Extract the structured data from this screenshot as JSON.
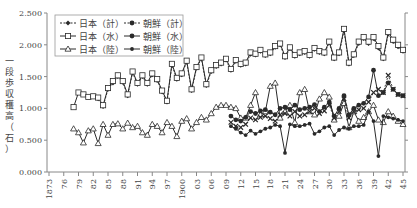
{
  "chart_data": {
    "type": "line",
    "title": "",
    "xlabel": "",
    "ylabel": "一段歩収穫高（石）",
    "ylim": [
      0,
      2.5
    ],
    "yticks": [
      "0.000",
      "0.500",
      "1.000",
      "1.500",
      "2.000",
      "2.500"
    ],
    "xticks": [
      "1873",
      "76",
      "79",
      "82",
      "85",
      "88",
      "91",
      "94",
      "97",
      "1900",
      "03",
      "06",
      "09",
      "12",
      "15",
      "18",
      "21",
      "24",
      "27",
      "30",
      "33",
      "36",
      "39",
      "42",
      "45"
    ],
    "xrange": [
      1873,
      1945
    ],
    "grid": false,
    "legend_position": "upper-left",
    "legend": [
      "日本（計）",
      "日本（水）",
      "日本（陸）",
      "朝鮮（計）",
      "朝鮮（水）",
      "朝鮮（陸）"
    ],
    "series": [
      {
        "name": "日本（水）",
        "marker": "open-square",
        "line": "solid",
        "x": [
          1878,
          1879,
          1880,
          1881,
          1882,
          1883,
          1884,
          1885,
          1886,
          1887,
          1888,
          1889,
          1890,
          1891,
          1892,
          1893,
          1894,
          1895,
          1896,
          1897,
          1898,
          1899,
          1900,
          1901,
          1902,
          1903,
          1904,
          1905,
          1906,
          1907,
          1908,
          1909,
          1910,
          1911,
          1912,
          1913,
          1914,
          1915,
          1916,
          1917,
          1918,
          1919,
          1920,
          1921,
          1922,
          1923,
          1924,
          1925,
          1926,
          1927,
          1928,
          1929,
          1930,
          1931,
          1932,
          1933,
          1934,
          1935,
          1936,
          1937,
          1938,
          1939,
          1940,
          1941,
          1942,
          1943,
          1944,
          1945
        ],
        "values": [
          1.02,
          1.25,
          1.22,
          1.18,
          1.19,
          1.17,
          1.05,
          1.32,
          1.43,
          1.52,
          1.43,
          1.22,
          1.58,
          1.4,
          1.52,
          1.4,
          1.55,
          1.46,
          1.28,
          1.12,
          1.7,
          1.48,
          1.55,
          1.75,
          1.3,
          1.65,
          1.8,
          1.38,
          1.6,
          1.68,
          1.72,
          1.78,
          1.62,
          1.76,
          1.7,
          1.72,
          1.88,
          1.86,
          1.92,
          1.85,
          1.88,
          1.98,
          2.02,
          1.82,
          1.96,
          1.84,
          1.88,
          1.9,
          1.84,
          1.95,
          1.9,
          1.88,
          2.05,
          1.8,
          1.88,
          2.25,
          1.72,
          1.85,
          2.05,
          2.12,
          2.05,
          2.12,
          1.98,
          1.8,
          2.2,
          2.08,
          2.0,
          1.92
        ]
      },
      {
        "name": "日本（計）",
        "marker": "filled-diamond",
        "line": "dashed",
        "x": [
          1883,
          1884,
          1885,
          1886,
          1887,
          1888,
          1889,
          1890,
          1891,
          1892,
          1893,
          1894,
          1895,
          1896,
          1897,
          1898,
          1899,
          1900,
          1901,
          1902,
          1903,
          1904,
          1905,
          1906,
          1907,
          1908,
          1909,
          1910,
          1911,
          1912,
          1913,
          1914,
          1915,
          1916,
          1917,
          1918,
          1919,
          1920,
          1921,
          1922,
          1923,
          1924,
          1925,
          1926,
          1927,
          1928,
          1929,
          1930,
          1931,
          1932,
          1933,
          1934,
          1935,
          1936,
          1937,
          1938,
          1939,
          1940,
          1941,
          1942,
          1943,
          1944,
          1945
        ],
        "values": [
          1.15,
          1.03,
          1.3,
          1.4,
          1.5,
          1.41,
          1.2,
          1.56,
          1.38,
          1.5,
          1.38,
          1.53,
          1.44,
          1.26,
          1.1,
          1.68,
          1.46,
          1.53,
          1.73,
          1.28,
          1.63,
          1.78,
          1.36,
          1.58,
          1.66,
          1.7,
          1.76,
          1.6,
          1.74,
          1.68,
          1.7,
          1.85,
          1.84,
          1.9,
          1.83,
          1.86,
          1.96,
          2.0,
          1.8,
          1.94,
          1.82,
          1.86,
          1.88,
          1.82,
          1.93,
          1.88,
          1.86,
          2.03,
          1.78,
          1.86,
          2.22,
          1.7,
          1.83,
          2.02,
          2.1,
          2.02,
          2.1,
          1.95,
          1.78,
          2.17,
          2.05,
          1.97,
          1.9
        ]
      },
      {
        "name": "日本（陸）",
        "marker": "open-triangle",
        "line": "solid",
        "x": [
          1878,
          1879,
          1880,
          1881,
          1882,
          1883,
          1884,
          1885,
          1886,
          1887,
          1888,
          1889,
          1890,
          1891,
          1892,
          1893,
          1894,
          1895,
          1896,
          1897,
          1898,
          1899,
          1900,
          1901,
          1902,
          1903,
          1904,
          1905,
          1906,
          1907,
          1908,
          1909,
          1910,
          1911,
          1912,
          1913,
          1914,
          1915,
          1916,
          1917,
          1918,
          1919,
          1920,
          1921,
          1922,
          1923,
          1924,
          1925,
          1926,
          1927,
          1928,
          1929,
          1930,
          1931,
          1932,
          1933,
          1934,
          1935,
          1936,
          1937,
          1938,
          1939,
          1940,
          1941,
          1942,
          1943,
          1944,
          1945
        ],
        "values": [
          0.68,
          0.62,
          0.46,
          0.65,
          0.68,
          0.45,
          0.75,
          0.58,
          0.75,
          0.76,
          0.68,
          0.77,
          0.7,
          0.72,
          0.62,
          0.58,
          0.75,
          0.72,
          0.62,
          0.78,
          0.72,
          0.56,
          0.8,
          0.84,
          0.68,
          0.78,
          0.86,
          0.82,
          0.92,
          1.02,
          1.05,
          1.05,
          1.02,
          1.0,
          0.85,
          0.85,
          1.05,
          1.25,
          0.9,
          0.95,
          1.35,
          1.4,
          0.85,
          0.95,
          1.05,
          0.78,
          1.25,
          1.3,
          0.95,
          0.9,
          1.15,
          1.25,
          1.18,
          0.82,
          0.88,
          1.08,
          0.7,
          0.95,
          0.8,
          0.86,
          0.95,
          1.05,
          0.82,
          0.78,
          0.95,
          0.88,
          0.8,
          0.75
        ]
      },
      {
        "name": "朝鮮（計）",
        "marker": "x-cross",
        "line": "dashed",
        "x": [
          1910,
          1911,
          1912,
          1913,
          1914,
          1915,
          1916,
          1917,
          1918,
          1919,
          1920,
          1921,
          1922,
          1923,
          1924,
          1925,
          1926,
          1927,
          1928,
          1929,
          1930,
          1931,
          1932,
          1933,
          1934,
          1935,
          1936,
          1937,
          1938,
          1939,
          1940,
          1941,
          1942,
          1943,
          1944,
          1945
        ],
        "values": [
          0.78,
          0.72,
          0.7,
          0.75,
          0.85,
          0.82,
          0.86,
          0.88,
          0.84,
          0.8,
          0.9,
          0.92,
          0.88,
          0.95,
          0.88,
          0.9,
          0.95,
          1.0,
          0.92,
          0.96,
          1.05,
          0.85,
          0.95,
          1.15,
          0.85,
          0.95,
          0.98,
          1.0,
          1.1,
          1.25,
          1.3,
          1.25,
          1.52,
          1.3,
          1.22,
          1.2
        ]
      },
      {
        "name": "朝鮮（水）",
        "marker": "filled-circle-bold",
        "line": "solid",
        "x": [
          1910,
          1911,
          1912,
          1913,
          1914,
          1915,
          1916,
          1917,
          1918,
          1919,
          1920,
          1921,
          1922,
          1923,
          1924,
          1925,
          1926,
          1927,
          1928,
          1929,
          1930,
          1931,
          1932,
          1933,
          1934,
          1935,
          1936,
          1937,
          1938,
          1939,
          1940,
          1941,
          1942,
          1943,
          1944,
          1945
        ],
        "values": [
          0.88,
          0.82,
          0.8,
          0.86,
          0.95,
          0.92,
          0.96,
          0.98,
          0.94,
          0.9,
          1.0,
          1.02,
          0.98,
          1.05,
          0.98,
          1.0,
          1.02,
          1.06,
          0.95,
          1.02,
          1.1,
          0.88,
          1.0,
          1.2,
          0.9,
          1.0,
          1.05,
          1.08,
          1.18,
          1.6,
          1.2,
          1.25,
          1.4,
          1.3,
          1.22,
          1.2
        ]
      },
      {
        "name": "朝鮮（陸）",
        "marker": "filled-circle",
        "line": "solid",
        "x": [
          1910,
          1911,
          1912,
          1913,
          1914,
          1915,
          1916,
          1917,
          1918,
          1919,
          1920,
          1921,
          1922,
          1923,
          1924,
          1925,
          1926,
          1927,
          1928,
          1929,
          1930,
          1931,
          1932,
          1933,
          1934,
          1935,
          1936,
          1937,
          1938,
          1939,
          1940,
          1941,
          1942,
          1943,
          1944,
          1945
        ],
        "values": [
          0.72,
          0.68,
          0.62,
          0.58,
          0.65,
          0.6,
          0.64,
          0.68,
          0.7,
          0.74,
          0.72,
          0.3,
          0.75,
          0.72,
          0.72,
          0.74,
          0.76,
          0.6,
          0.64,
          0.7,
          0.72,
          0.58,
          0.66,
          0.7,
          0.68,
          0.72,
          0.72,
          0.74,
          0.95,
          0.8,
          0.25,
          0.88,
          0.86,
          0.84,
          0.82,
          0.8
        ]
      }
    ]
  },
  "legend": {
    "items": [
      {
        "label": "日本（計）",
        "style": "dashed-filled-diamond"
      },
      {
        "label": "朝鮮（計）",
        "style": "dashed-x"
      },
      {
        "label": "日本（水）",
        "style": "solid-open-square"
      },
      {
        "label": "朝鮮（水）",
        "style": "solid-filled-bold"
      },
      {
        "label": "日本（陸）",
        "style": "solid-open-triangle"
      },
      {
        "label": "朝鮮（陸）",
        "style": "solid-filled-circle"
      }
    ]
  },
  "axis": {
    "ylabel_chars": [
      "一",
      "段",
      "歩",
      "収",
      "穫",
      "高",
      "（",
      "石",
      "）"
    ]
  },
  "colors": {
    "line": "#2a2a2a",
    "axis": "#888888",
    "text": "#444444"
  }
}
